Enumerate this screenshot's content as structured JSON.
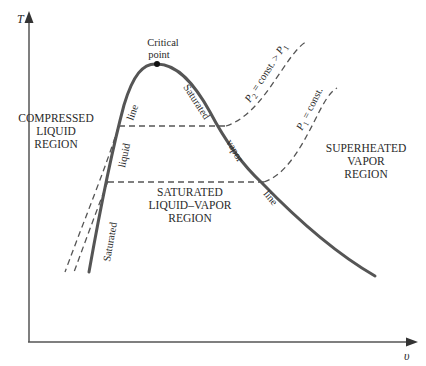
{
  "diagram": {
    "axes": {
      "y_label": "T",
      "x_label": "υ"
    },
    "critical_point": {
      "line1": "Critical",
      "line2": "point"
    },
    "regions": {
      "compressed": [
        "COMPRESSED",
        "LIQUID",
        "REGION"
      ],
      "saturated_mixture": [
        "SATURATED",
        "LIQUID–VAPOR",
        "REGION"
      ],
      "superheated": [
        "SUPERHEATED",
        "VAPOR",
        "REGION"
      ]
    },
    "curve_labels": {
      "sat_liquid": [
        "Saturated",
        "liquid",
        "line"
      ],
      "sat_vapor": [
        "Saturated",
        "vapor",
        "line"
      ]
    },
    "isobars": {
      "p2": {
        "symbol": "P",
        "sub": "2",
        "text": " = const. > ",
        "symbol2": "P",
        "sub2": "1"
      },
      "p1": {
        "symbol": "P",
        "sub": "1",
        "text": " = const."
      }
    },
    "colors": {
      "curve": "#555555",
      "text": "#2a2a2a",
      "background": "#ffffff"
    }
  }
}
